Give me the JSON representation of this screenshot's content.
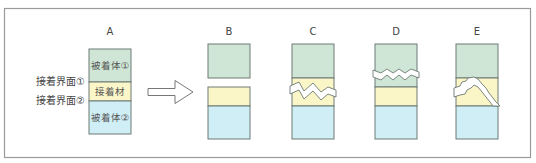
{
  "colors": {
    "adherend1": "#cfe6d6",
    "adhesive": "#fbf6c8",
    "adherend2": "#cfeef5",
    "border": "#6d7a74"
  },
  "panels": [
    {
      "id": "A",
      "label": "A"
    },
    {
      "id": "B",
      "label": "B"
    },
    {
      "id": "C",
      "label": "C"
    },
    {
      "id": "D",
      "label": "D"
    },
    {
      "id": "E",
      "label": "E"
    }
  ],
  "panel_a": {
    "adherend1_label": "被着体①",
    "adhesive_label": "接着材",
    "adherend2_label": "被着体②",
    "interface1_label": "接着界面①",
    "interface2_label": "接着界面②"
  },
  "arrow": "right-arrow"
}
